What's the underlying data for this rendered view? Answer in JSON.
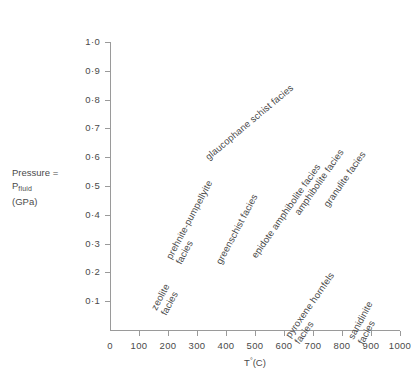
{
  "chart_data": {
    "type": "scatter",
    "title": "",
    "xlabel": "T°(C)",
    "ylabel": "Pressure = P fluid (GPa)",
    "xlim": [
      0,
      1000
    ],
    "ylim": [
      0,
      1.0
    ],
    "grid": false,
    "legend": "none",
    "x_ticks": [
      0,
      100,
      200,
      300,
      400,
      500,
      600,
      700,
      800,
      900,
      1000
    ],
    "x_tick_labels": [
      "0",
      "100",
      "200",
      "300",
      "400",
      "500",
      "600",
      "700",
      "800",
      "900",
      "1000"
    ],
    "y_ticks": [
      0.1,
      0.2,
      0.3,
      0.4,
      0.5,
      0.6,
      0.7,
      0.8,
      0.9,
      1.0
    ],
    "y_tick_labels": [
      "0·1",
      "0·2",
      "0·3",
      "0·4",
      "0·5",
      "0·6",
      "0·7",
      "0·8",
      "0·9",
      "1·0"
    ],
    "annotations": [
      {
        "text": "zeolite\nfacies",
        "T": 200,
        "P": 0.12,
        "rotation": 62
      },
      {
        "text": "prehnite-pumpellyite\nfacies",
        "T": 250,
        "P": 0.3,
        "rotation": 62
      },
      {
        "text": "greenschist facies",
        "T": 390,
        "P": 0.26,
        "rotation": 62
      },
      {
        "text": "glaucophane schist facies",
        "T": 345,
        "P": 0.62,
        "rotation": 40
      },
      {
        "text": "epidote amphibolite facies",
        "T": 510,
        "P": 0.28,
        "rotation": 55
      },
      {
        "text": "amphibolite facies",
        "T": 660,
        "P": 0.43,
        "rotation": 55
      },
      {
        "text": "granulite facies",
        "T": 760,
        "P": 0.46,
        "rotation": 55
      },
      {
        "text": "pyroxene hornfels\nfacies",
        "T": 660,
        "P": 0.02,
        "rotation": 55
      },
      {
        "text": "sanidinite facies",
        "T": 880,
        "P": 0.02,
        "rotation": 62
      }
    ]
  },
  "axis_titles": {
    "y_line1": "Pressure =",
    "y_line2_main": "P",
    "y_line2_sub": "fluid",
    "y_line3": "(GPa)",
    "x_main_before": "T",
    "x_degree": "°",
    "x_main_after": "(C)"
  },
  "facies_labels": [
    {
      "name": "zeolite-facies",
      "line1": "zeolite",
      "line2": "facies"
    },
    {
      "name": "prehnite-pumpellyite-facies",
      "line1": "prehnite-pumpellyite",
      "line2": "facies"
    },
    {
      "name": "greenschist-facies",
      "line1": "greenschist facies",
      "line2": ""
    },
    {
      "name": "glaucophane-schist-facies",
      "line1": "glaucophane schist facies",
      "line2": ""
    },
    {
      "name": "epidote-amphibolite-facies",
      "line1": "epidote amphibolite facies",
      "line2": ""
    },
    {
      "name": "amphibolite-facies",
      "line1": "amphibolite facies",
      "line2": ""
    },
    {
      "name": "granulite-facies",
      "line1": "granulite facies",
      "line2": ""
    },
    {
      "name": "pyroxene-hornfels-facies",
      "line1": "pyroxene hornfels",
      "line2": "facies"
    },
    {
      "name": "sanidinite-facies",
      "line1": "sanidinite",
      "line2": "facies"
    }
  ],
  "colors": {
    "axis": "#9a9a9a",
    "text": "#4a4a4a",
    "background": "#ffffff"
  }
}
